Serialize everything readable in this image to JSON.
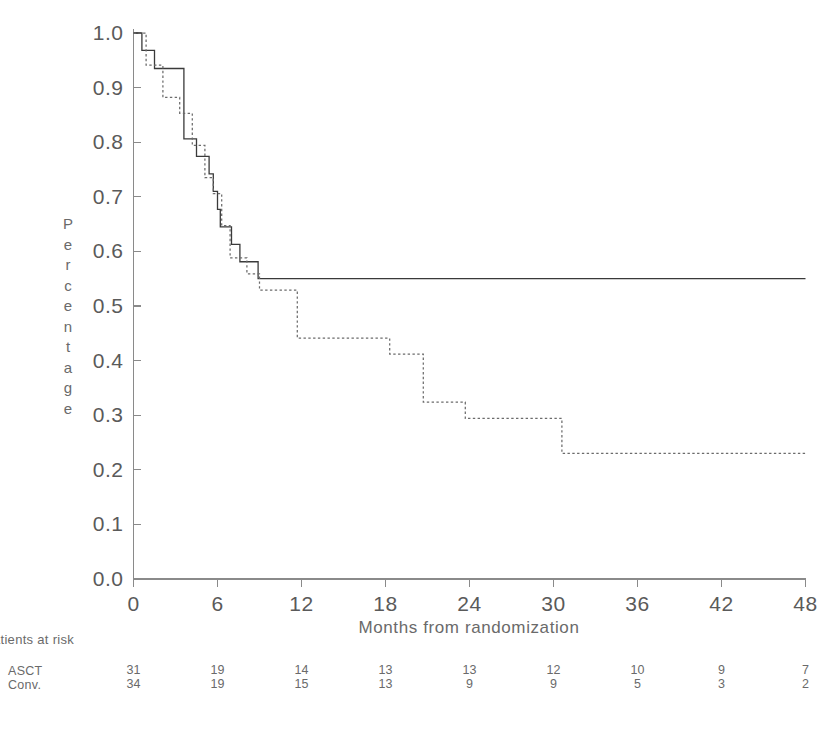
{
  "chart_data": {
    "type": "line",
    "title": "",
    "xlabel": "Months from randomization",
    "ylabel": "Percentage",
    "xlim": [
      0,
      48
    ],
    "ylim": [
      0.0,
      1.0
    ],
    "xticks": [
      0,
      6,
      12,
      18,
      24,
      30,
      36,
      42,
      48
    ],
    "xtick_labels": [
      "0",
      "6",
      "12",
      "18",
      "24",
      "30",
      "36",
      "42",
      "48"
    ],
    "yticks": [
      0.0,
      0.1,
      0.2,
      0.3,
      0.4,
      0.5,
      0.6,
      0.7,
      0.8,
      0.9,
      1.0
    ],
    "ytick_labels": [
      "0.0",
      "0.1",
      "0.2",
      "0.3",
      "0.4",
      "0.5",
      "0.6",
      "0.7",
      "0.8",
      "0.9",
      "1.0"
    ],
    "grid": false,
    "legend_position": "none",
    "curve_style": "step",
    "series": [
      {
        "name": "ASCT",
        "line_style": "solid",
        "color": "#3a3a3a",
        "points": [
          [
            0.0,
            1.0
          ],
          [
            0.6,
            1.0
          ],
          [
            0.6,
            0.968
          ],
          [
            1.5,
            0.968
          ],
          [
            1.5,
            0.935
          ],
          [
            3.6,
            0.935
          ],
          [
            3.6,
            0.806
          ],
          [
            4.5,
            0.806
          ],
          [
            4.5,
            0.774
          ],
          [
            5.4,
            0.774
          ],
          [
            5.4,
            0.742
          ],
          [
            5.7,
            0.742
          ],
          [
            5.7,
            0.71
          ],
          [
            6.0,
            0.71
          ],
          [
            6.0,
            0.677
          ],
          [
            6.2,
            0.677
          ],
          [
            6.2,
            0.645
          ],
          [
            7.0,
            0.645
          ],
          [
            7.0,
            0.613
          ],
          [
            7.6,
            0.613
          ],
          [
            7.6,
            0.581
          ],
          [
            8.9,
            0.581
          ],
          [
            8.9,
            0.55
          ],
          [
            48.0,
            0.55
          ]
        ]
      },
      {
        "name": "Conv.",
        "line_style": "dashed",
        "color": "#6b6b6b",
        "points": [
          [
            0.0,
            1.0
          ],
          [
            0.9,
            1.0
          ],
          [
            0.9,
            0.941
          ],
          [
            2.1,
            0.941
          ],
          [
            2.1,
            0.882
          ],
          [
            3.3,
            0.882
          ],
          [
            3.3,
            0.853
          ],
          [
            4.2,
            0.853
          ],
          [
            4.2,
            0.794
          ],
          [
            5.1,
            0.794
          ],
          [
            5.1,
            0.735
          ],
          [
            5.7,
            0.735
          ],
          [
            5.7,
            0.706
          ],
          [
            6.3,
            0.706
          ],
          [
            6.3,
            0.647
          ],
          [
            6.9,
            0.647
          ],
          [
            6.9,
            0.588
          ],
          [
            8.1,
            0.588
          ],
          [
            8.1,
            0.559
          ],
          [
            9.0,
            0.559
          ],
          [
            9.0,
            0.529
          ],
          [
            11.7,
            0.529
          ],
          [
            11.7,
            0.441
          ],
          [
            18.3,
            0.441
          ],
          [
            18.3,
            0.412
          ],
          [
            20.7,
            0.412
          ],
          [
            20.7,
            0.324
          ],
          [
            23.7,
            0.324
          ],
          [
            23.7,
            0.294
          ],
          [
            30.6,
            0.294
          ],
          [
            30.6,
            0.23
          ],
          [
            48.0,
            0.23
          ]
        ]
      }
    ]
  },
  "risk_table": {
    "title": "Patients at risk",
    "time_points": [
      0,
      6,
      12,
      18,
      24,
      30,
      36,
      42,
      48
    ],
    "rows": [
      {
        "label": "ASCT",
        "values": [
          "31",
          "19",
          "14",
          "13",
          "13",
          "12",
          "10",
          "9",
          "7"
        ]
      },
      {
        "label": "Conv.",
        "values": [
          "34",
          "19",
          "15",
          "13",
          "9",
          "9",
          "5",
          "3",
          "2"
        ]
      }
    ]
  },
  "axis": {
    "line_color": "#8a8a8a",
    "text_color": "#5a5a5a"
  }
}
